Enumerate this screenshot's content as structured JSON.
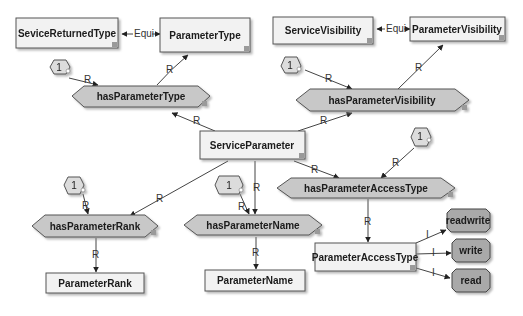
{
  "diagram": {
    "concepts": {
      "sevice_returned_type": "SeviceReturnedType",
      "parameter_type": "ParameterType",
      "service_visibility": "ServiceVisibility",
      "parameter_visibility": "ParameterVisibility",
      "service_parameter": "ServiceParameter",
      "parameter_rank": "ParameterRank",
      "parameter_name": "ParameterName",
      "parameter_access_type": "ParameterAccessType"
    },
    "relations": {
      "has_parameter_type": "hasParameterType",
      "has_parameter_visibility": "hasParameterVisibility",
      "has_parameter_access_type": "hasParameterAccessType",
      "has_parameter_rank": "hasParameterRank",
      "has_parameter_name": "hasParameterName"
    },
    "instances": {
      "readwrite": "readwrite",
      "write": "write",
      "read": "read"
    },
    "cardinalities": {
      "type": "1",
      "visibility": "1",
      "access_type": "1",
      "rank": "1",
      "name": "1"
    },
    "edge_labels": {
      "equi": "Equi",
      "relation": "R",
      "instance": "I"
    },
    "colors": {
      "concept_fill": "#f2f2f2",
      "relation_fill": "#c8c8c8",
      "instance_fill": "#a9a9a9",
      "border": "#555555"
    }
  }
}
